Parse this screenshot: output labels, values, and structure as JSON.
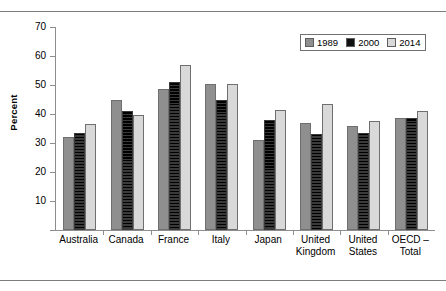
{
  "chart_data": {
    "type": "bar",
    "title": "",
    "xlabel": "",
    "ylabel": "Percent",
    "ylim": [
      0,
      70
    ],
    "yticks": [
      0,
      10,
      20,
      30,
      40,
      50,
      60,
      70
    ],
    "grid": false,
    "legend_position": "top-right",
    "categories": [
      "Australia",
      "Canada",
      "France",
      "Italy",
      "Japan",
      "United Kingdom",
      "United States",
      "OECD – Total"
    ],
    "category_lines": [
      [
        "Australia"
      ],
      [
        "Canada"
      ],
      [
        "France"
      ],
      [
        "Italy"
      ],
      [
        "Japan"
      ],
      [
        "United",
        "Kingdom"
      ],
      [
        "United",
        "States"
      ],
      [
        "OECD –",
        "Total"
      ]
    ],
    "series": [
      {
        "name": "1989",
        "color": "#8f8f8f",
        "values": [
          32.0,
          45.0,
          48.5,
          50.5,
          31.0,
          37.0,
          36.0,
          38.5
        ]
      },
      {
        "name": "2000",
        "color": "#111111",
        "values": [
          33.5,
          41.0,
          51.0,
          45.0,
          38.0,
          33.0,
          33.5,
          38.5
        ]
      },
      {
        "name": "2014",
        "color": "#d9d9d9",
        "values": [
          36.5,
          39.5,
          57.0,
          50.5,
          41.5,
          43.5,
          37.5,
          41.0
        ]
      }
    ]
  },
  "legend": {
    "items": [
      {
        "label": "1989"
      },
      {
        "label": "2000"
      },
      {
        "label": "2014"
      }
    ]
  }
}
